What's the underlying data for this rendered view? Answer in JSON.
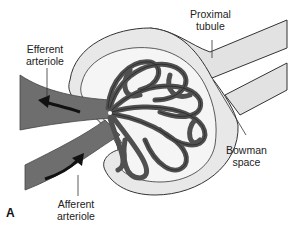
{
  "figure": {
    "panel": "A",
    "labels": {
      "efferent_line1": "Efferent",
      "efferent_line2": "arteriole",
      "proximal_line1": "Proximal",
      "proximal_line2": "tubule",
      "bowman_line1": "Bowman",
      "bowman_line2": "space",
      "afferent_line1": "Afferent",
      "afferent_line2": "arteriole"
    },
    "colors": {
      "vessel": "#6b6b6b",
      "capillary": "#555555",
      "capsule": "#e6e6e6",
      "outline": "#333333",
      "arrow": "#111111"
    }
  }
}
